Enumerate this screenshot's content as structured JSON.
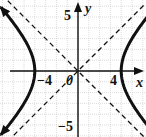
{
  "chart_data": {
    "type": "line",
    "title": "",
    "xlabel": "x",
    "ylabel": "y",
    "xlim": [
      -7,
      6.3
    ],
    "ylim": [
      -6,
      6.5
    ],
    "grid": true,
    "tick_labels": {
      "x": [
        {
          "value": -4,
          "label": "−4"
        },
        {
          "value": 0,
          "label": "0"
        },
        {
          "value": 4,
          "label": "4"
        }
      ],
      "y": [
        {
          "value": 5,
          "label": "5"
        },
        {
          "value": -5,
          "label": "−5"
        }
      ]
    },
    "series": [
      {
        "name": "right-branch",
        "style": "solid-thick-arrows",
        "equation": "x = sqrt(16 + y^2)",
        "vertex": [
          4,
          0
        ]
      },
      {
        "name": "left-branch",
        "style": "solid-thick-arrows",
        "equation": "x = -sqrt(16 + y^2)",
        "vertex": [
          -4,
          0
        ]
      },
      {
        "name": "asymptote-positive",
        "style": "dashed",
        "equation": "y = x"
      },
      {
        "name": "asymptote-negative",
        "style": "dashed",
        "equation": "y = -x"
      }
    ]
  },
  "labels": {
    "x_axis": "x",
    "y_axis": "y",
    "tick_x_neg4": "−4",
    "tick_origin": "0",
    "tick_x_4": "4",
    "tick_y_5": "5",
    "tick_y_neg5": "−5"
  },
  "colors": {
    "curve": "#111111",
    "grid": "#bbbbbb",
    "axis": "#111111"
  }
}
